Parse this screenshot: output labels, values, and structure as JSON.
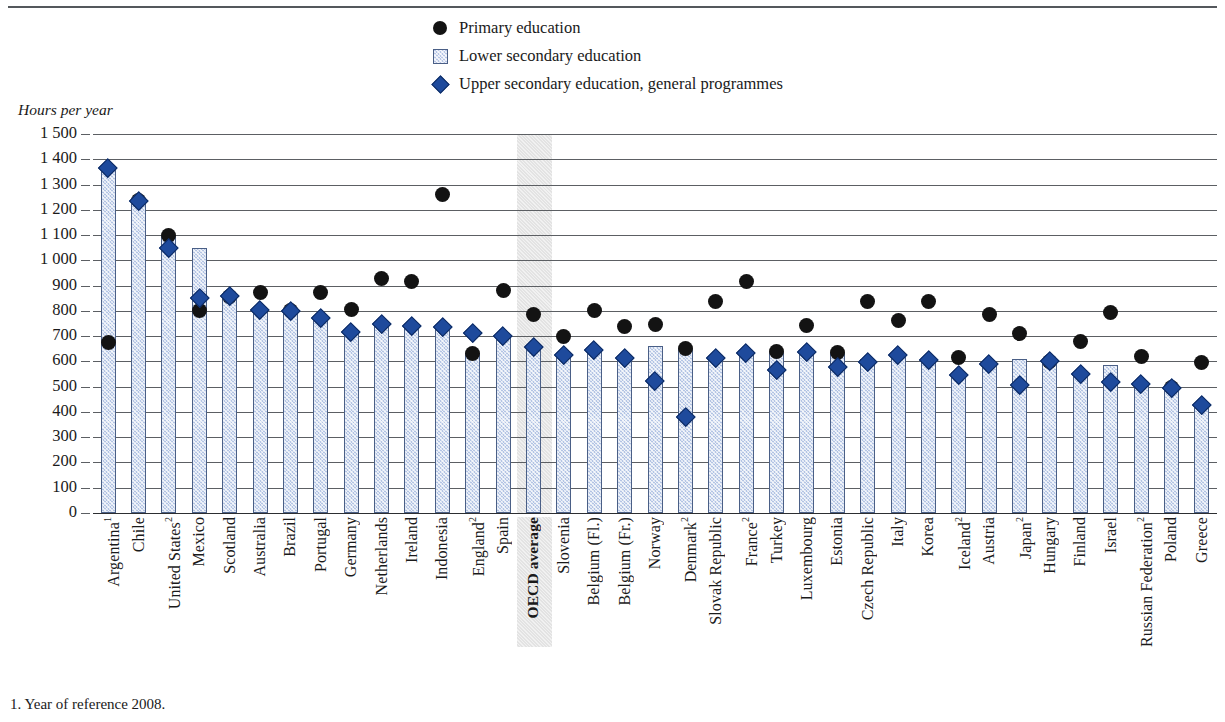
{
  "axis_title": "Hours per year",
  "footnote": "1. Year of reference 2008.",
  "legend": [
    {
      "label": "Primary education",
      "marker": "circle-marker",
      "color": "#131313"
    },
    {
      "label": "Lower secondary education",
      "marker": "square-marker",
      "color": "#b3c4e4"
    },
    {
      "label": "Upper secondary education, general programmes",
      "marker": "diamond-marker",
      "color": "#1e4a9c"
    }
  ],
  "chart_data": {
    "type": "bar",
    "title": "",
    "xlabel": "",
    "ylabel": "Hours per year",
    "ylim": [
      0,
      1500
    ],
    "ytick_step": 100,
    "ytick_labels": [
      "1 500",
      "1 400",
      "1 300",
      "1 200",
      "1 100",
      "1 000",
      "900",
      "800",
      "700",
      "600",
      "500",
      "400",
      "300",
      "200",
      "100",
      "0"
    ],
    "grid": true,
    "legend_position": "top-center",
    "highlight_category": "OECD average",
    "categories": [
      "Argentina¹",
      "Chile",
      "United States²",
      "Mexico",
      "Scotland",
      "Australia",
      "Brazil",
      "Portugal",
      "Germany",
      "Netherlands",
      "Ireland",
      "Indonesia",
      "England²",
      "Spain",
      "OECD average",
      "Slovenia",
      "Belgium (Fl.)",
      "Belgium (Fr.)",
      "Norway",
      "Denmark²",
      "Slovak Republic",
      "France²",
      "Turkey",
      "Luxembourg",
      "Estonia",
      "Czech Republic",
      "Italy",
      "Korea",
      "Iceland²",
      "Austria",
      "Japan²",
      "Hungary",
      "Finland",
      "Israel",
      "Russian Federation²",
      "Poland",
      "Greece"
    ],
    "category_labels_html": [
      "Argentina<sup>1</sup>",
      "Chile",
      "United States<sup>2</sup>",
      "Mexico",
      "Scotland",
      "Australia",
      "Brazil",
      "Portugal",
      "Germany",
      "Netherlands",
      "Ireland",
      "Indonesia",
      "England<sup>2</sup>",
      "Spain",
      "OECD average",
      "Slovenia",
      "Belgium (Fl.)",
      "Belgium (Fr.)",
      "Norway",
      "Denmark<sup>2</sup>",
      "Slovak Republic",
      "France<sup>2</sup>",
      "Turkey",
      "Luxembourg",
      "Estonia",
      "Czech Republic",
      "Italy",
      "Korea",
      "Iceland<sup>2</sup>",
      "Austria",
      "Japan<sup>2</sup>",
      "Hungary",
      "Finland",
      "Israel",
      "Russian Federation<sup>2</sup>",
      "Poland",
      "Greece"
    ],
    "series": [
      {
        "name": "Lower secondary education",
        "kind": "bar",
        "values": [
          1368,
          1235,
          1097,
          1047,
          858,
          803,
          800,
          780,
          717,
          750,
          735,
          735,
          633,
          700,
          658,
          630,
          646,
          614,
          660,
          648,
          616,
          626,
          639,
          639,
          635,
          608,
          617,
          609,
          547,
          589,
          608,
          601,
          553,
          587,
          510,
          495,
          430
        ]
      },
      {
        "name": "Primary education",
        "kind": "scatter",
        "marker": "circle",
        "values": [
          676,
          1235,
          1097,
          800,
          858,
          871,
          800,
          874,
          804,
          930,
          915,
          1260,
          633,
          880,
          784,
          700,
          803,
          740,
          745,
          650,
          837,
          918,
          639,
          743,
          635,
          837,
          763,
          837,
          617,
          784,
          711,
          601,
          680,
          794,
          619,
          495,
          594
        ]
      },
      {
        "name": "Upper secondary education, general programmes",
        "kind": "scatter",
        "marker": "diamond",
        "values": [
          1368,
          1235,
          1050,
          850,
          858,
          803,
          800,
          772,
          717,
          750,
          741,
          737,
          714,
          700,
          658,
          625,
          646,
          614,
          523,
          381,
          616,
          633,
          567,
          639,
          578,
          600,
          625,
          606,
          547,
          589,
          508,
          601,
          553,
          520,
          510,
          495,
          430
        ]
      }
    ]
  }
}
